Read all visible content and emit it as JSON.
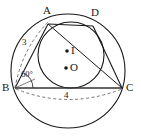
{
  "figure": {
    "type": "geometry-diagram",
    "colors": {
      "stroke": "#1a1a1a",
      "dashed": "#555555",
      "background": "#ffffff",
      "chord": "#333333"
    },
    "vertices": [
      {
        "name": "A",
        "label": "A",
        "x": 48,
        "y": 24,
        "label_x": 43,
        "label_y": 7
      },
      {
        "name": "D",
        "label": "D",
        "x": 93,
        "y": 26,
        "label_x": 91,
        "label_y": 9
      },
      {
        "name": "B",
        "label": "B",
        "x": 15,
        "y": 88,
        "label_x": 3,
        "label_y": 82
      },
      {
        "name": "C",
        "label": "C",
        "x": 122,
        "y": 88,
        "label_x": 126,
        "label_y": 82
      }
    ],
    "centers": [
      {
        "name": "I",
        "label": "I",
        "x": 67,
        "y": 51,
        "label_x": 71,
        "label_y": 45
      },
      {
        "name": "O",
        "label": "O",
        "x": 66,
        "y": 68,
        "label_x": 70,
        "label_y": 62
      }
    ],
    "measures": [
      {
        "name": "side-ab",
        "label": "3",
        "x": 24,
        "y": 43
      },
      {
        "name": "side-bc",
        "label": "4",
        "x": 66,
        "y": 96
      },
      {
        "name": "angle-b",
        "label": "60°",
        "x": 23,
        "y": 74
      }
    ],
    "circles": [
      {
        "name": "circumcircle",
        "cx": 68,
        "cy": 71,
        "rx": 57,
        "ry": 57
      },
      {
        "name": "incircle",
        "cx": 71,
        "cy": 55,
        "rx": 33,
        "ry": 33
      }
    ]
  }
}
